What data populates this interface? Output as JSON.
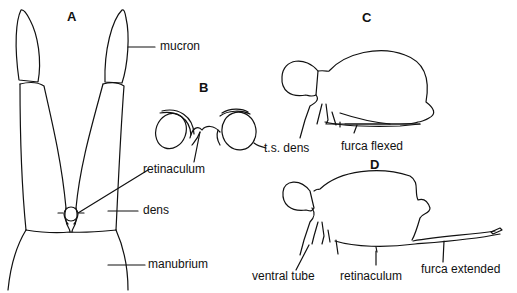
{
  "figure": {
    "panels": {
      "A": "A",
      "B": "B",
      "C": "C",
      "D": "D"
    },
    "labels": {
      "mucron": "mucron",
      "retinaculum_b": "retinaculum",
      "ts_dens": "t.s. dens",
      "dens": "dens",
      "manubrium": "manubrium",
      "furca_flexed": "furca flexed",
      "ventral_tube": "ventral tube",
      "retinaculum_d": "retinaculum",
      "furca_extended": "furca extended"
    },
    "line_color": "#111111",
    "background": "#ffffff"
  }
}
